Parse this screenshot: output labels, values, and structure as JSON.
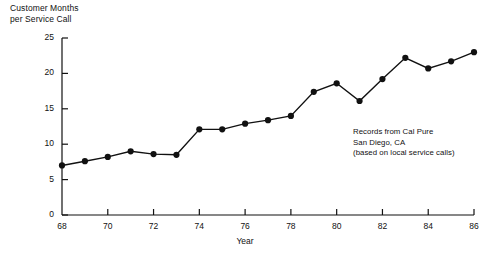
{
  "chart_data": {
    "type": "line",
    "title": "Customer Months\nper Service Call",
    "ylabel": "Customer Months per Service Call",
    "xlabel": "Year",
    "x": [
      68,
      69,
      70,
      71,
      72,
      73,
      74,
      75,
      76,
      77,
      78,
      79,
      80,
      81,
      82,
      83,
      84,
      85,
      86
    ],
    "categories": [
      "68",
      "69",
      "70",
      "71",
      "72",
      "73",
      "74",
      "75",
      "76",
      "77",
      "78",
      "79",
      "80",
      "81",
      "82",
      "83",
      "84",
      "85",
      "86"
    ],
    "values": [
      7,
      7.6,
      8.2,
      9,
      8.6,
      8.5,
      12.1,
      12.1,
      12.9,
      13.4,
      14,
      17.4,
      18.6,
      16.1,
      19.2,
      22.2,
      20.7,
      21.7,
      23
    ],
    "xlim": [
      68,
      86
    ],
    "ylim": [
      0,
      25
    ],
    "ytick_labels": [
      "0",
      "5",
      "10",
      "15",
      "20",
      "25"
    ],
    "yticks": [
      0,
      5,
      10,
      15,
      20,
      25
    ],
    "xtick_labels": [
      "68",
      "70",
      "72",
      "74",
      "76",
      "78",
      "80",
      "82",
      "84",
      "86"
    ],
    "xticks": [
      68,
      70,
      72,
      74,
      76,
      78,
      80,
      82,
      84,
      86
    ],
    "grid": false,
    "legend": false,
    "marker": "filled-circle",
    "line_color": "#111111",
    "marker_color": "#111111",
    "annotation": "Records from Cal Pure\nSan Diego, CA\n(based on local service calls)"
  }
}
